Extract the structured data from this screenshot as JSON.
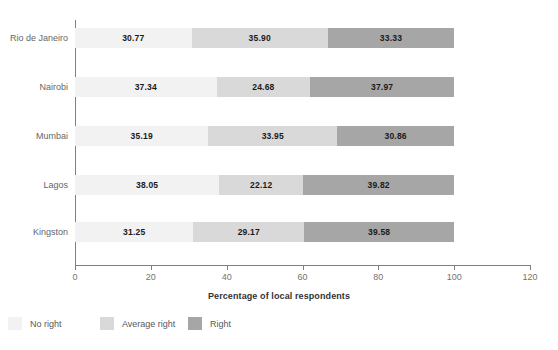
{
  "chart_data": {
    "type": "bar",
    "orientation": "horizontal",
    "stacked": true,
    "title": "",
    "xlabel": "Percentage of local respondents",
    "ylabel": "",
    "xlim": [
      0,
      120
    ],
    "xticks": [
      0,
      20,
      40,
      60,
      80,
      100,
      120
    ],
    "xticklabels": [
      "0",
      "20",
      "40",
      "60",
      "80",
      "100",
      "120"
    ],
    "grid": false,
    "legend_position": "bottom-left",
    "categories": [
      "Rio de Janeiro",
      "Nairobi",
      "Mumbai",
      "Lagos",
      "Kingston"
    ],
    "series": [
      {
        "name": "No right",
        "color": "#f2f2f2",
        "values": [
          30.77,
          37.34,
          35.19,
          38.05,
          31.25
        ],
        "labels": [
          "30.77",
          "37.34",
          "35.19",
          "38.05",
          "31.25"
        ]
      },
      {
        "name": "Average right",
        "color": "#d9d9d9",
        "values": [
          35.9,
          24.68,
          33.95,
          22.12,
          29.17
        ],
        "labels": [
          "35.90",
          "24.68",
          "33.95",
          "22.12",
          "29.17"
        ]
      },
      {
        "name": "Right",
        "color": "#a6a6a6",
        "values": [
          33.33,
          37.97,
          30.86,
          39.82,
          39.58
        ],
        "labels": [
          "33.33",
          "37.97",
          "30.86",
          "39.82",
          "39.58"
        ]
      }
    ]
  },
  "axis": {
    "x_title": "Percentage of local respondents"
  },
  "legend": {
    "items": [
      {
        "label": "No right",
        "color": "#f2f2f2"
      },
      {
        "label": "Average right",
        "color": "#d9d9d9"
      },
      {
        "label": "Right",
        "color": "#a6a6a6"
      }
    ]
  }
}
